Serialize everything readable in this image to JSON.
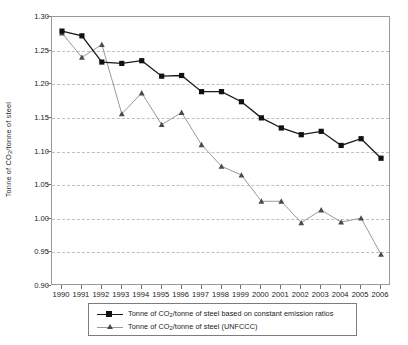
{
  "chart_data": {
    "type": "line",
    "title": "",
    "xlabel": "",
    "ylabel": "Tonne of CO2/tonne of steel",
    "ylabel_parts": {
      "pre": "Tonne of CO",
      "sub": "2",
      "post": "/tonne of steel"
    },
    "categories": [
      1990,
      1991,
      1992,
      1993,
      1994,
      1995,
      1996,
      1997,
      1998,
      1999,
      2000,
      2001,
      2002,
      2003,
      2004,
      2005,
      2006
    ],
    "xtick_labels": [
      "1990",
      "1991",
      "1992",
      "1993",
      "1994",
      "1995",
      "1996",
      "1997",
      "1998",
      "1999",
      "2000",
      "2001",
      "2002",
      "2003",
      "2004",
      "2005",
      "2006"
    ],
    "ylim": [
      0.9,
      1.3
    ],
    "yticks": [
      0.9,
      0.95,
      1.0,
      1.05,
      1.1,
      1.15,
      1.2,
      1.25,
      1.3
    ],
    "ytick_labels": [
      "0.90",
      "0.95",
      "1.00",
      "1.05",
      "1.10",
      "1.15",
      "1.20",
      "1.25",
      "1.30"
    ],
    "grid": true,
    "grid_color": "#c9b9c4",
    "legend_position": "below",
    "series": [
      {
        "name": "Tonne of CO2/tonne of steel based on constant emission ratios",
        "label_parts": {
          "pre": "Tonne of CO",
          "sub": "2",
          "post": "/tonne of steel based on constant emission ratios"
        },
        "marker": "square",
        "color": "#111111",
        "line_color": "#1a1a1a",
        "values": [
          1.279,
          1.272,
          1.233,
          1.231,
          1.235,
          1.212,
          1.213,
          1.189,
          1.189,
          1.174,
          1.15,
          1.135,
          1.125,
          1.13,
          1.109,
          1.119,
          1.09
        ]
      },
      {
        "name": "Tonne of CO2/tonne of steel (UNFCCC)",
        "label_parts": {
          "pre": "Tonne of CO",
          "sub": "2",
          "post": "/tonne of steel (UNFCCC)"
        },
        "marker": "triangle",
        "color": "#4a4a4a",
        "line_color": "#9a9a9a",
        "values": [
          1.276,
          1.24,
          1.259,
          1.156,
          1.187,
          1.14,
          1.158,
          1.11,
          1.078,
          1.065,
          1.026,
          1.026,
          0.994,
          1.013,
          0.995,
          1.001,
          0.947
        ]
      }
    ]
  }
}
